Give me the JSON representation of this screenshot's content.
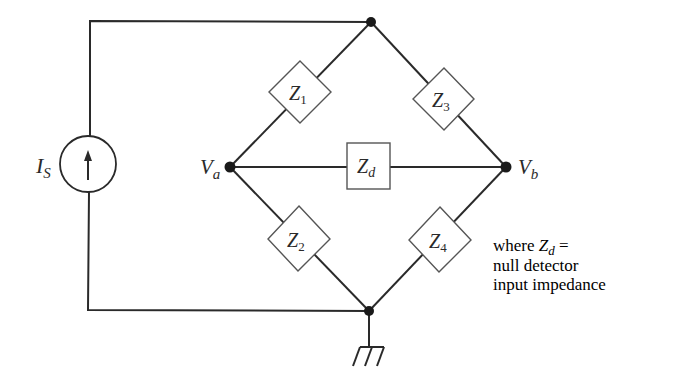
{
  "diagram": {
    "type": "bridge-circuit",
    "source": {
      "label": "I",
      "subscript": "S",
      "icon": "current-source-up-arrow"
    },
    "nodes": {
      "left": {
        "label": "V",
        "subscript": "a"
      },
      "right": {
        "label": "V",
        "subscript": "b"
      }
    },
    "impedances": [
      {
        "label": "Z",
        "subscript": "1"
      },
      {
        "label": "Z",
        "subscript": "2"
      },
      {
        "label": "Z",
        "subscript": "3"
      },
      {
        "label": "Z",
        "subscript": "4"
      },
      {
        "label": "Z",
        "subscript": "d"
      }
    ],
    "note": {
      "prefix": "where ",
      "symbol": "Z",
      "symbol_sub": "d",
      "suffix": " =",
      "line2": "null detector",
      "line3": "input impedance"
    },
    "ground_icon": "ground-symbol"
  }
}
